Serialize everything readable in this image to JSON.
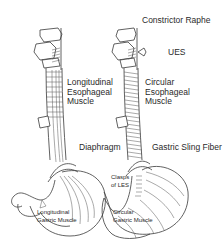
{
  "figure": {
    "left_panel": {
      "title": "Longitudinal muscle layer",
      "labels": {
        "esophageal_muscle": [
          "Longitudinal",
          "Esophageal",
          "Muscle"
        ],
        "diaphragm": "Diaphragm",
        "gastric_muscle": [
          "Longitudinal",
          "Gastric Muscle"
        ]
      }
    },
    "right_panel": {
      "labels": {
        "constrictor_raphe": "Constrictor Raphe",
        "ues": "UES",
        "esophageal_muscle": [
          "Circular",
          "Esophageal",
          "Muscle"
        ],
        "gastric_sling_fiber": "Gastric Sling Fiber",
        "clasps": [
          "Clasps",
          "of LES"
        ],
        "gastric_muscle": [
          "Circular",
          "Gastric Muscle"
        ]
      }
    },
    "colors": {
      "line": "#3a3a3a",
      "text": "#2a2a2a",
      "background": "#ffffff"
    }
  }
}
